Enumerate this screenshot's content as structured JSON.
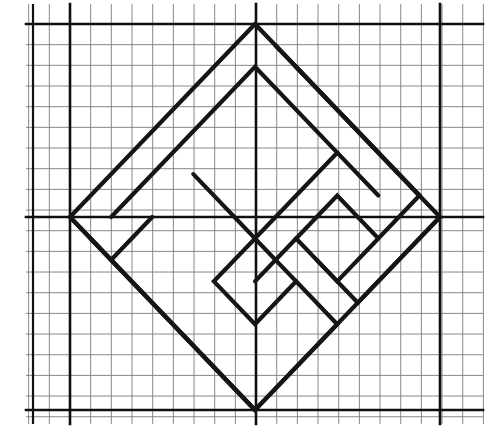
{
  "figure": {
    "kind": "line-drawing",
    "width": 497,
    "height": 433,
    "background_color": "#ffffff",
    "ink_color": "#151515"
  },
  "grid": {
    "name": "graph-paper-grid",
    "cell_size": 20.67,
    "origin_x": 70,
    "origin_y": 24,
    "minor_color": "#6b6b6b",
    "minor_width": 0.9,
    "major_color": "#101010",
    "major_width": 2.6,
    "extent": {
      "x_min": 26,
      "x_max": 483,
      "y_min": 4,
      "y_max": 424
    },
    "minor_x": [
      26,
      49,
      70,
      91,
      111,
      132,
      153,
      173,
      194,
      215,
      235,
      256,
      277,
      297,
      318,
      339,
      359,
      380,
      401,
      421,
      440,
      462,
      483
    ],
    "minor_y": [
      4,
      24,
      45,
      65,
      86,
      107,
      127,
      148,
      169,
      189,
      210,
      217,
      231,
      252,
      272,
      293,
      314,
      334,
      355,
      376,
      396,
      410,
      424
    ],
    "major_x": [
      70,
      256,
      440
    ],
    "major_y": [
      24,
      217,
      410
    ],
    "edge_x": [
      33
    ],
    "edge_y": []
  },
  "diamond": {
    "name": "outer-diamond",
    "vertices": {
      "top": {
        "x": 256,
        "y": 24
      },
      "right": {
        "x": 440,
        "y": 217
      },
      "bottom": {
        "x": 256,
        "y": 410
      },
      "left": {
        "x": 70,
        "y": 217
      }
    },
    "half_width": 185,
    "half_height": 193,
    "stroke_width": 4.2
  },
  "spiral": {
    "name": "nested-spiral-paths",
    "description": "Two interleaved rectilinear spiral arms rotated 45 degrees, nested inside the outer diamond; arms wind clockwise inward from the top and bottom vertices.",
    "stroke_width": 4.2,
    "stroke_color": "#151515",
    "paths": [
      {
        "id": "arm-outer-left",
        "label": "outer left arm",
        "points": "70,217 256,24"
      },
      {
        "id": "arm-outer-bottom-left",
        "label": "outer bottom-left arm",
        "points": "70,217 256,410"
      },
      {
        "id": "arm-outer-top-right",
        "label": "outer top-right arm",
        "points": "256,24 440,217"
      },
      {
        "id": "arm-outer-bottom-right",
        "label": "outer bottom-right arm",
        "points": "440,217 256,410"
      },
      {
        "id": "arm-a",
        "label": "spiral arm A (from left notch inward)",
        "points": "91,238 112,217 256,66 318,128 256,190 225,221 256,252 287,283 256,314 132,190"
      },
      {
        "id": "arm-a-main",
        "label": "spiral arm A main run",
        "points": "91,238 184,334 256,410"
      },
      {
        "id": "arm-b",
        "label": "spiral arm B",
        "points": "256,66 112,217 184,293 256,221 318,159 380,221 318,283 287,314 256,283"
      },
      {
        "id": "arm-c",
        "label": "spiral arm C",
        "points": "297,107 421,231 359,293 318,252 339,231 380,190"
      }
    ],
    "polylines": [
      {
        "id": "spiral-outer-ring",
        "label": "outer diamond ring",
        "closed": true,
        "points": "256,24 440,217 256,410 70,217"
      },
      {
        "id": "spiral-arm-1",
        "label": "spiral arm starting below top vertex, winding inward clockwise",
        "closed": false,
        "points": "277,45 421,190 401,210 359,252 318,210 277,252 318,293 359,252"
      },
      {
        "id": "spiral-arm-2",
        "label": "second spiral arm, longer wrap",
        "closed": false,
        "points": "91,238 112,262 235,390 256,369 297,328 256,283 215,242 256,200 297,242"
      },
      {
        "id": "spiral-arm-3",
        "label": "third spiral arm",
        "closed": false,
        "points": "112,217 256,66 339,148 256,231 194,169"
      }
    ],
    "turn_vertices": [
      {
        "name": "notch-left-upper",
        "x": 91,
        "y": 238
      },
      {
        "name": "notch-left-inner",
        "x": 184,
        "y": 255
      },
      {
        "name": "notch-center-left",
        "x": 225,
        "y": 221
      },
      {
        "name": "notch-center-right",
        "x": 330,
        "y": 255
      },
      {
        "name": "notch-inner-right",
        "x": 365,
        "y": 293
      },
      {
        "name": "notch-right-outer",
        "x": 400,
        "y": 255
      },
      {
        "name": "notch-bottom-inner",
        "x": 297,
        "y": 328
      },
      {
        "name": "notch-upper-right",
        "x": 318,
        "y": 128
      }
    ]
  },
  "chart_data": {
    "type": "line",
    "xlabel": "",
    "ylabel": "",
    "xlim": [
      -9,
      13
    ],
    "ylim": [
      -10,
      10
    ],
    "grid": true,
    "legend": "none",
    "note": "Diagram units: one grid cell = 1 unit; bold rules every 9 cells form the axes at x=0 and y=0.",
    "series": [
      {
        "name": "outer diamond",
        "x": [
          0,
          9,
          0,
          -9,
          0
        ],
        "y": [
          9,
          0,
          -9,
          0,
          9
        ]
      },
      {
        "name": "spiral arm A",
        "x": [
          -8,
          -7,
          0,
          3,
          0,
          -1.5,
          0,
          1.5,
          0,
          -5
        ],
        "y": [
          -1,
          0,
          7,
          4,
          1,
          -0.2,
          -1.7,
          -3.2,
          -4.7,
          1.3
        ]
      },
      {
        "name": "spiral arm B",
        "x": [
          1,
          8,
          7,
          5,
          3,
          1,
          3,
          5
        ],
        "y": [
          8,
          1,
          0,
          -2,
          0,
          -2,
          -4,
          -2
        ]
      }
    ]
  }
}
